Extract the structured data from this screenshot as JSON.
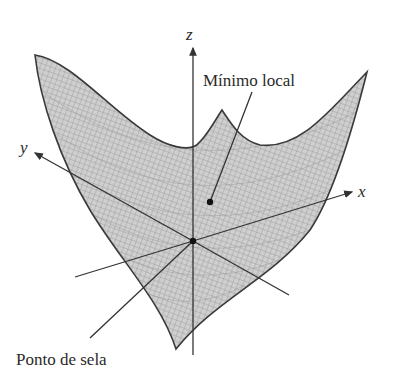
{
  "diagram": {
    "type": "3d-surface",
    "axes": {
      "x": "x",
      "y": "y",
      "z": "z"
    },
    "annotations": {
      "local_min": "Mínimo local",
      "saddle": "Ponto de sela"
    },
    "colors": {
      "surface_fill": "#c9c9c9",
      "mesh": "#8a8a8a",
      "edge": "#3a3a3a",
      "axis": "#333333"
    }
  }
}
